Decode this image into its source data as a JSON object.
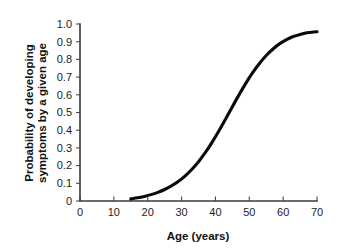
{
  "chart_data": {
    "type": "line",
    "title": "",
    "subtitle": "",
    "xlabel": "Age (years)",
    "ylabel": "Probability of developing symptoms by a given age",
    "ylabel_line1": "Probability of developing",
    "ylabel_line2": "symptoms by a given age",
    "xlim": [
      0,
      70
    ],
    "ylim": [
      0,
      1.0
    ],
    "xticks": [
      0,
      10,
      20,
      30,
      40,
      50,
      60,
      70
    ],
    "xtick_labels": [
      "0",
      "10",
      "20",
      "30",
      "40",
      "50",
      "60",
      "70"
    ],
    "yticks": [
      0,
      0.1,
      0.2,
      0.3,
      0.4,
      0.5,
      0.6,
      0.7,
      0.8,
      0.9,
      1.0
    ],
    "ytick_labels": [
      "0",
      "0.1",
      "0.2",
      "0.3",
      "0.4",
      "0.5",
      "0.6",
      "0.7",
      "0.8",
      "0.9",
      "1.0"
    ],
    "grid": false,
    "legend": false,
    "legend_position": "none",
    "series": [
      {
        "name": "Cumulative probability of symptom onset",
        "color": "#0a0a0a",
        "line_width": 3.1,
        "x": [
          15,
          17,
          19,
          21,
          23,
          25,
          27,
          29,
          31,
          33,
          35,
          37,
          39,
          41,
          43,
          45,
          47,
          49,
          51,
          53,
          55,
          57,
          59,
          61,
          63,
          65,
          67,
          69,
          70
        ],
        "y": [
          0.012,
          0.018,
          0.026,
          0.036,
          0.049,
          0.065,
          0.085,
          0.11,
          0.141,
          0.178,
          0.222,
          0.273,
          0.331,
          0.395,
          0.463,
          0.533,
          0.601,
          0.666,
          0.725,
          0.777,
          0.822,
          0.859,
          0.889,
          0.912,
          0.929,
          0.941,
          0.95,
          0.955,
          0.956
        ]
      }
    ],
    "annotations": [],
    "notes": {
      "curve_start_age": 15,
      "curve_start_probability": 0.012,
      "curve_end_age": 70,
      "curve_end_probability": 0.956,
      "midpoint_age": 47
    }
  },
  "plot_box": {
    "left": 80,
    "right": 317,
    "top": 24,
    "bottom": 201
  }
}
